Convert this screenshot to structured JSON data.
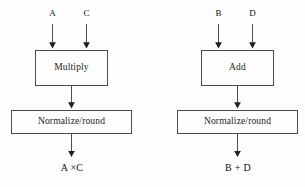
{
  "diagram": {
    "type": "flowchart",
    "title": "",
    "background_color": "#fdfdfd",
    "line_color": "#4a4a4a",
    "text_color": "#141414",
    "panels": [
      {
        "id": "multiply-pipeline",
        "inputs": [
          {
            "label": "A"
          },
          {
            "label": "C"
          }
        ],
        "stages": [
          {
            "label": "Multiply"
          },
          {
            "label": "Normalize/round"
          }
        ],
        "output": {
          "label": "A ×C"
        }
      },
      {
        "id": "add-pipeline",
        "inputs": [
          {
            "label": "B"
          },
          {
            "label": "D"
          }
        ],
        "stages": [
          {
            "label": "Add"
          },
          {
            "label": "Normalize/round"
          }
        ],
        "output": {
          "label": "B + D"
        }
      }
    ]
  }
}
